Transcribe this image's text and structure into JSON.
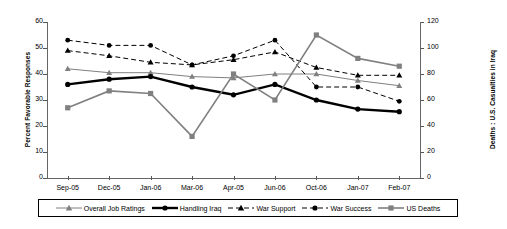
{
  "chart_data": {
    "type": "line",
    "title": "",
    "xlabel": "",
    "ylabel": "Percent Favorable Responses",
    "ylabel_right": "Deaths : U.S. Casualties in Iraq",
    "grid": false,
    "legend_position": "bottom",
    "categories": [
      "Sep-05",
      "Dec-05",
      "Jan-06",
      "Mar-06",
      "Apr-05",
      "Jun-06",
      "Oct-06",
      "Jan-07",
      "Feb-07"
    ],
    "ylim": [
      0,
      60
    ],
    "yticks": [
      0,
      10,
      20,
      30,
      40,
      50,
      60
    ],
    "ylim_right": [
      0,
      120
    ],
    "yticks_right": [
      0,
      20,
      40,
      60,
      80,
      100,
      120
    ],
    "series": [
      {
        "name": "Overall Job Ratings",
        "axis": "left",
        "color": "#808080",
        "marker": "triangle",
        "dash": false,
        "width": 1,
        "values": [
          42,
          40.5,
          40.5,
          39,
          38.5,
          40,
          40,
          37.5,
          35.5
        ]
      },
      {
        "name": "Handling Iraq",
        "axis": "left",
        "color": "#000000",
        "marker": "circle",
        "dash": false,
        "width": 2.4,
        "values": [
          36,
          38,
          39,
          35,
          32,
          36,
          30,
          26.5,
          25.5
        ]
      },
      {
        "name": "War Support",
        "axis": "left",
        "color": "#000000",
        "marker": "triangle",
        "dash": true,
        "width": 1,
        "values": [
          49,
          47,
          44.5,
          43.5,
          45.5,
          48.5,
          42.5,
          39.5,
          39.5
        ]
      },
      {
        "name": "War Success",
        "axis": "left",
        "color": "#000000",
        "marker": "circle",
        "dash": true,
        "width": 1,
        "values": [
          53,
          51,
          51,
          43.5,
          47,
          53,
          35,
          35,
          29.5
        ]
      },
      {
        "name": "US Deaths",
        "axis": "right",
        "color": "#808080",
        "marker": "square",
        "dash": false,
        "width": 1.6,
        "values": [
          54,
          67,
          65,
          32,
          80,
          60,
          110,
          92,
          86
        ]
      }
    ]
  },
  "legend": {
    "items": [
      {
        "label": "Overall Job Ratings"
      },
      {
        "label": "Handling Iraq"
      },
      {
        "label": "War Support"
      },
      {
        "label": "War Success"
      },
      {
        "label": "US Deaths"
      }
    ]
  }
}
